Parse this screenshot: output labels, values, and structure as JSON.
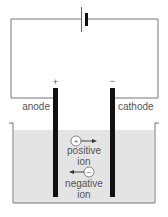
{
  "diagram": {
    "electrodes": {
      "anode": {
        "label": "anode",
        "sign": "+"
      },
      "cathode": {
        "label": "cathode",
        "sign": "−"
      }
    },
    "ions": {
      "positive": {
        "symbol": "+",
        "label_line1": "positive",
        "label_line2": "ion",
        "direction": "right"
      },
      "negative": {
        "symbol": "−",
        "label_line1": "negative",
        "label_line2": "ion",
        "direction": "left"
      }
    },
    "components": [
      "battery",
      "wire",
      "anode",
      "cathode",
      "electrolyte-tank"
    ],
    "colors": {
      "wire": "#555555",
      "electrode": "#111111",
      "electrolyte": "#e4e4e4",
      "text": "#555555"
    }
  }
}
